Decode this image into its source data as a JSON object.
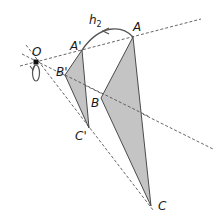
{
  "diagram": {
    "colors": {
      "fill": "#c4c4c4",
      "stroke": "#3a3a3a",
      "dashed": "#555555",
      "text": "#1a1a1a"
    },
    "center": {
      "label": "O",
      "x": 36,
      "y": 62
    },
    "transformation": {
      "label": "h",
      "subscript": "2"
    },
    "triangle_original": {
      "vertices": [
        {
          "label": "A",
          "x": 133,
          "y": 37
        },
        {
          "label": "B",
          "x": 101,
          "y": 98
        },
        {
          "label": "C",
          "x": 151,
          "y": 206
        }
      ]
    },
    "triangle_image": {
      "vertices": [
        {
          "label": "A'",
          "x": 82,
          "y": 50
        },
        {
          "label": "B'",
          "x": 65,
          "y": 75
        },
        {
          "label": "C'",
          "x": 89,
          "y": 128
        }
      ]
    },
    "labels": {
      "O": "O",
      "A": "A",
      "B": "B",
      "C": "C",
      "A_prime": "A'",
      "B_prime": "B'",
      "C_prime": "C'",
      "h": "h",
      "h_sub": "2"
    }
  }
}
